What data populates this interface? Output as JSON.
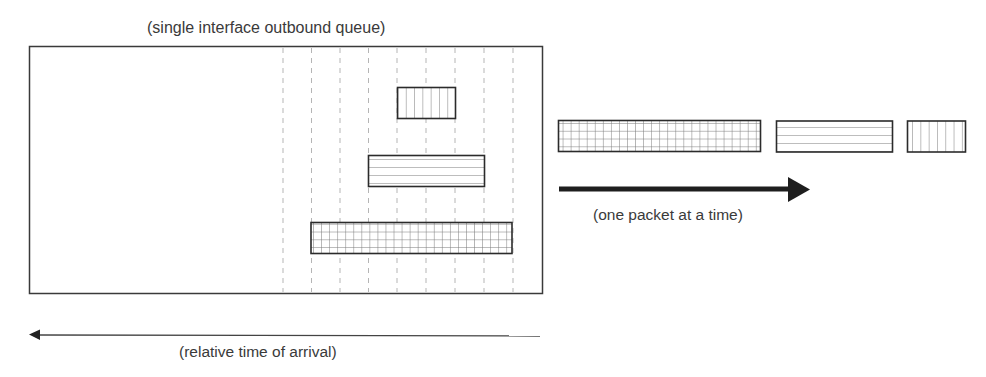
{
  "diagram": {
    "queue_title": "(single interface outbound queue)",
    "transmit_caption": "(one packet at a time)",
    "arrival_caption": "(relative time of arrival)",
    "colors": {
      "stroke": "#2b2b2b",
      "pattern": "#8a8a8a",
      "dashed": "#b0b0b0",
      "arrow": "#1e1e1e"
    },
    "queue": {
      "dashed_columns": 9,
      "packets": [
        {
          "id": "packet-vertical",
          "pattern": "vertical-lines",
          "size": "small"
        },
        {
          "id": "packet-horizontal",
          "pattern": "horizontal-lines",
          "size": "medium"
        },
        {
          "id": "packet-grid",
          "pattern": "grid",
          "size": "large"
        }
      ]
    },
    "output_sequence": [
      {
        "id": "out-packet-grid",
        "pattern": "grid",
        "size": "large"
      },
      {
        "id": "out-packet-horizontal",
        "pattern": "horizontal-lines",
        "size": "medium"
      },
      {
        "id": "out-packet-vertical",
        "pattern": "vertical-lines",
        "size": "small"
      }
    ]
  }
}
